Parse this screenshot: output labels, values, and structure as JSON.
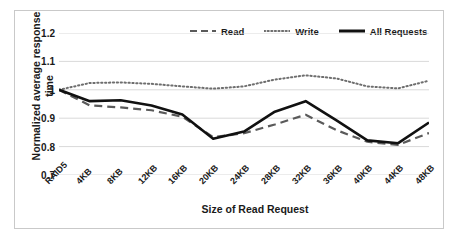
{
  "chart_data": {
    "type": "line",
    "title": "",
    "xlabel": "Size of Read Request",
    "ylabel": "Normalized average response time",
    "ylabel_line1": "Normalized average response",
    "ylabel_line2": "time",
    "categories": [
      "RAID5",
      "4KB",
      "8KB",
      "12KB",
      "16KB",
      "20KB",
      "24KB",
      "28KB",
      "32KB",
      "36KB",
      "40KB",
      "44KB",
      "48KB"
    ],
    "ylim": [
      0.7,
      1.2
    ],
    "yticks": [
      "0.7",
      "0.8",
      "0.9",
      "1",
      "1.1",
      "1.2"
    ],
    "ytick_values": [
      0.7,
      0.8,
      0.9,
      1.0,
      1.1,
      1.2
    ],
    "grid": true,
    "legend_position": "top",
    "series": [
      {
        "name": "Read",
        "style": "dashed",
        "color": "#5a5a5a",
        "values": [
          1.0,
          0.945,
          0.938,
          0.928,
          0.905,
          0.833,
          0.847,
          0.878,
          0.912,
          0.858,
          0.817,
          0.806,
          0.848
        ]
      },
      {
        "name": "Write",
        "style": "dotted",
        "color": "#6e6e6e",
        "values": [
          1.0,
          1.024,
          1.026,
          1.021,
          1.012,
          1.004,
          1.012,
          1.036,
          1.051,
          1.04,
          1.012,
          1.005,
          1.032
        ]
      },
      {
        "name": "All Requests",
        "style": "solid",
        "color": "#111111",
        "values": [
          1.0,
          0.96,
          0.963,
          0.945,
          0.913,
          0.828,
          0.853,
          0.923,
          0.96,
          0.892,
          0.822,
          0.812,
          0.885
        ]
      }
    ]
  }
}
